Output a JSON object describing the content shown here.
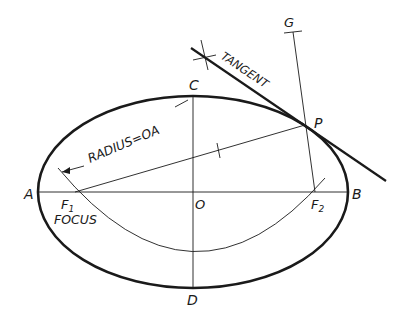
{
  "diagram": {
    "points": {
      "A": "A",
      "B": "B",
      "C": "C",
      "D": "D",
      "O": "O",
      "P": "P",
      "G": "G",
      "F1": "F",
      "F1_sub": "1",
      "F2": "F",
      "F2_sub": "2"
    },
    "annotations": {
      "tangent": "TANGENT",
      "radius": "RADIUS=OA",
      "focus": "FOCUS"
    },
    "colors": {
      "ink": "#1a1a1a",
      "background": "#ffffff"
    }
  }
}
